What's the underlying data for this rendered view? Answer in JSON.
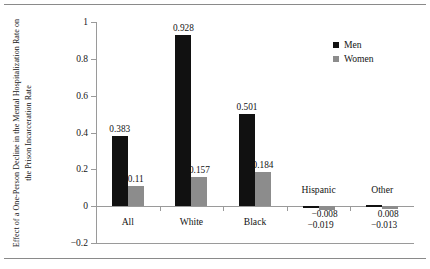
{
  "figure": {
    "y_axis_title": "Effect of a One-Person Decline in the Mental Hospitalization Rate on the Prison Incarceration Rate"
  },
  "legend": {
    "position": "top-right",
    "entries": [
      {
        "label": "Men",
        "color": "#111111"
      },
      {
        "label": "Women",
        "color": "#8c8c8c"
      }
    ]
  },
  "chart_data": {
    "type": "bar",
    "title": "",
    "xlabel": "",
    "ylabel": "Effect of a One-Person Decline in the Mental Hospitalization Rate on the Prison Incarceration Rate",
    "categories": [
      "All",
      "White",
      "Black",
      "Hispanic",
      "Other"
    ],
    "series": [
      {
        "name": "Men",
        "color": "#111111",
        "values": [
          0.383,
          0.928,
          0.501,
          -0.008,
          0.008
        ],
        "labels": [
          "0.383",
          "0.928",
          "0.501",
          "−0.008",
          "0.008"
        ]
      },
      {
        "name": "Women",
        "color": "#8c8c8c",
        "values": [
          0.11,
          0.157,
          0.184,
          -0.019,
          -0.013
        ],
        "labels": [
          "0.11",
          "0.157",
          "0.184",
          "−0.019",
          "−0.013"
        ]
      }
    ],
    "ylim": [
      -0.2,
      1
    ],
    "yticks": [
      1,
      0.8,
      0.6,
      0.4,
      0.2,
      0,
      -0.2
    ],
    "ytick_labels": [
      "1",
      "0.8",
      "0.6",
      "0.4",
      "0.2",
      "0",
      "−0.2"
    ],
    "grid": false,
    "legend_position": "top-right"
  }
}
